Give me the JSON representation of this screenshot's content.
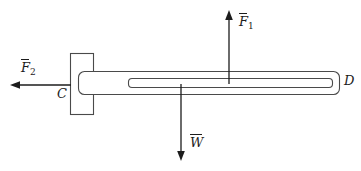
{
  "figure": {
    "type": "free-body-diagram",
    "title": "",
    "background_color": "#ffffff",
    "line_color": "#4a4a4a",
    "arrow_color": "#1c1c1c"
  },
  "labels": {
    "force1": {
      "symbol": "F",
      "subscript": "1",
      "vector": true,
      "text": "F"
    },
    "force2": {
      "symbol": "F",
      "subscript": "2",
      "vector": true,
      "text": "F"
    },
    "weight": {
      "symbol": "W",
      "subscript": "",
      "vector": true,
      "text": "W"
    },
    "point_c": {
      "text": "C"
    },
    "point_d": {
      "text": "D"
    }
  },
  "arrows": [
    {
      "name": "force-1-arrow",
      "label": "F1",
      "direction": "up",
      "x": 229,
      "from_y": 84,
      "to_y": 12
    },
    {
      "name": "force-2-arrow",
      "label": "F2",
      "direction": "left",
      "y": 85,
      "from_x": 71,
      "to_x": 11
    },
    {
      "name": "weight-arrow",
      "label": "W",
      "direction": "down",
      "x": 181,
      "from_y": 84,
      "to_y": 160
    }
  ],
  "shapes": {
    "support_bracket": {
      "name": "support-bracket",
      "x": 70,
      "y": 53,
      "width": 24,
      "height": 62
    },
    "beam_outer": {
      "name": "beam-outer",
      "x": 78,
      "y": 71,
      "width": 262,
      "height": 24,
      "radius": 6
    },
    "beam_inner": {
      "name": "beam-inner-channel",
      "x": 128,
      "y": 78,
      "width": 205,
      "height": 10,
      "radius": 4
    }
  }
}
